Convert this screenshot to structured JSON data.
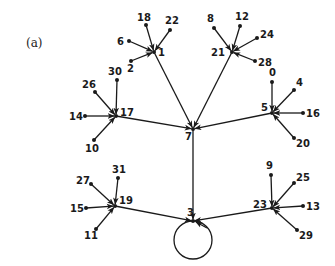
{
  "figure": {
    "panel_label": "(a)",
    "nodes": [
      {
        "id": "0",
        "label": "0"
      },
      {
        "id": "1",
        "label": "1"
      },
      {
        "id": "2",
        "label": "2"
      },
      {
        "id": "3",
        "label": "3"
      },
      {
        "id": "4",
        "label": "4"
      },
      {
        "id": "5",
        "label": "5"
      },
      {
        "id": "6",
        "label": "6"
      },
      {
        "id": "7",
        "label": "7"
      },
      {
        "id": "8",
        "label": "8"
      },
      {
        "id": "9",
        "label": "9"
      },
      {
        "id": "10",
        "label": "10"
      },
      {
        "id": "11",
        "label": "11"
      },
      {
        "id": "12",
        "label": "12"
      },
      {
        "id": "13",
        "label": "13"
      },
      {
        "id": "14",
        "label": "14"
      },
      {
        "id": "15",
        "label": "15"
      },
      {
        "id": "16",
        "label": "16"
      },
      {
        "id": "17",
        "label": "17"
      },
      {
        "id": "18",
        "label": "18"
      },
      {
        "id": "19",
        "label": "19"
      },
      {
        "id": "20",
        "label": "20"
      },
      {
        "id": "21",
        "label": "21"
      },
      {
        "id": "22",
        "label": "22"
      },
      {
        "id": "23",
        "label": "23"
      },
      {
        "id": "24",
        "label": "24"
      },
      {
        "id": "25",
        "label": "25"
      },
      {
        "id": "26",
        "label": "26"
      },
      {
        "id": "27",
        "label": "27"
      },
      {
        "id": "28",
        "label": "28"
      },
      {
        "id": "29",
        "label": "29"
      },
      {
        "id": "30",
        "label": "30"
      },
      {
        "id": "31",
        "label": "31"
      }
    ],
    "edges": [
      {
        "from": "18",
        "to": "1"
      },
      {
        "from": "22",
        "to": "1"
      },
      {
        "from": "6",
        "to": "1"
      },
      {
        "from": "2",
        "to": "1"
      },
      {
        "from": "8",
        "to": "21"
      },
      {
        "from": "12",
        "to": "21"
      },
      {
        "from": "24",
        "to": "21"
      },
      {
        "from": "28",
        "to": "21"
      },
      {
        "from": "30",
        "to": "17"
      },
      {
        "from": "26",
        "to": "17"
      },
      {
        "from": "14",
        "to": "17"
      },
      {
        "from": "10",
        "to": "17"
      },
      {
        "from": "0",
        "to": "5"
      },
      {
        "from": "4",
        "to": "5"
      },
      {
        "from": "16",
        "to": "5"
      },
      {
        "from": "20",
        "to": "5"
      },
      {
        "from": "1",
        "to": "7"
      },
      {
        "from": "21",
        "to": "7"
      },
      {
        "from": "17",
        "to": "7"
      },
      {
        "from": "5",
        "to": "7"
      },
      {
        "from": "31",
        "to": "19"
      },
      {
        "from": "27",
        "to": "19"
      },
      {
        "from": "15",
        "to": "19"
      },
      {
        "from": "11",
        "to": "19"
      },
      {
        "from": "9",
        "to": "23"
      },
      {
        "from": "25",
        "to": "23"
      },
      {
        "from": "13",
        "to": "23"
      },
      {
        "from": "29",
        "to": "23"
      },
      {
        "from": "7",
        "to": "3"
      },
      {
        "from": "19",
        "to": "3"
      },
      {
        "from": "23",
        "to": "3"
      },
      {
        "from": "3",
        "to": "3",
        "self_loop": true
      }
    ]
  }
}
